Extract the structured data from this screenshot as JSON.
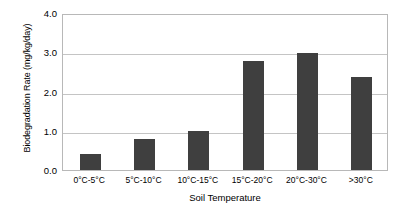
{
  "chart_data": {
    "type": "bar",
    "title": "",
    "xlabel": "Soil Temperature",
    "ylabel": "Biodegradation Rate (mg/kg/day)",
    "categories": [
      "0°C-5°C",
      "5°C-10°C",
      "10°C-15°C",
      "15°C-20°C",
      "20°C-30°C",
      ">30°C"
    ],
    "values": [
      0.41,
      0.8,
      0.99,
      2.78,
      2.97,
      2.36
    ],
    "ylim": [
      0.0,
      4.0
    ],
    "ytick_labels": [
      "0.0",
      "1.0",
      "2.0",
      "3.0",
      "4.0"
    ],
    "ytick_values": [
      0.0,
      1.0,
      2.0,
      3.0,
      4.0
    ],
    "grid": "horizontal",
    "legend": "none",
    "bar_color": "#3f3f3f",
    "gridline_color": "#c4c4c4",
    "frame_color": "#b8b8b8",
    "background_color": "#ffffff"
  },
  "axes": {
    "y_title": "Biodegradation Rate (mg/kg/day)",
    "x_title": "Soil Temperature"
  }
}
